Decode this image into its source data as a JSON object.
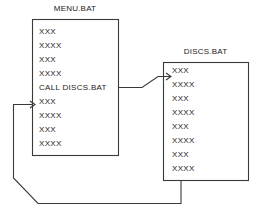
{
  "diagram": {
    "type": "flow-diagram",
    "stroke_color": "#3a3a3a",
    "background_color": "#ffffff",
    "text_color": "#1a1a1a",
    "boxes": [
      {
        "id": "menu-bat",
        "title": "MENU.BAT",
        "lines": [
          "XXX",
          "XXXX",
          "XXX",
          "XXXX",
          "CALL DISCS.BAT",
          "XXX",
          "XXXX",
          "XXX",
          "XXXX"
        ]
      },
      {
        "id": "discs-bat",
        "title": "DISCS.BAT",
        "lines": [
          "XXX",
          "XXXX",
          "XXX",
          "XXXX",
          "XXX",
          "XXXX",
          "XXX",
          "XXXX"
        ]
      }
    ],
    "connectors": [
      {
        "id": "call-arrow",
        "from": "menu-bat.line.5",
        "to": "discs-bat.line.1",
        "label": "call"
      },
      {
        "id": "return-arrow",
        "from": "discs-bat.line.8",
        "to": "menu-bat.line.6",
        "label": "return"
      }
    ]
  }
}
